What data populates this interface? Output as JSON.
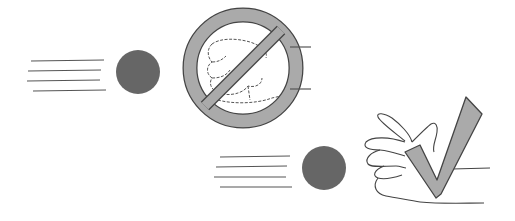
{
  "illustration": {
    "description": "Two scenes: a ball flying toward a closed fist inside a prohibition sign, and a ball flying toward an open hand with a checkmark",
    "colors": {
      "ball": "#666666",
      "symbol_fill": "#a8a8a8",
      "symbol_stroke": "#444444",
      "line": "#555555",
      "background": "#ffffff"
    },
    "scenes": [
      {
        "label": "incorrect-catch-fist",
        "symbol": "prohibited-icon",
        "hand": "closed-fist"
      },
      {
        "label": "correct-catch-open-hand",
        "symbol": "checkmark-icon",
        "hand": "open-hand"
      }
    ]
  }
}
